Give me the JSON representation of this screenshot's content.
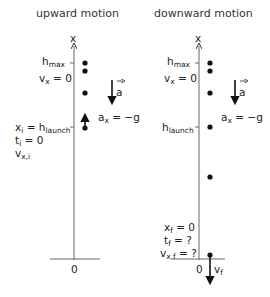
{
  "panels": {
    "upward": {
      "title": "upward motion",
      "axis_label": "x",
      "origin_label": "0",
      "top": {
        "h": "h",
        "h_sub": "max",
        "v": "v",
        "v_sub": "x",
        "v_eq": " = 0"
      },
      "accel": {
        "vector": "a",
        "a": "a",
        "a_sub": "x",
        "a_eq": " = −g"
      },
      "launch": {
        "x": "x",
        "x_sub": "i",
        "eq": " = h",
        "h_sub": "launch",
        "t": "t",
        "t_sub": "i",
        "t_eq": " = 0",
        "v": "v",
        "v_sub": "x,i"
      }
    },
    "downward": {
      "title": "downward motion",
      "axis_label": "x",
      "origin_label": "0",
      "top": {
        "h": "h",
        "h_sub": "max",
        "v": "v",
        "v_sub": "x",
        "v_eq": " = 0"
      },
      "accel": {
        "vector": "a",
        "a": "a",
        "a_sub": "x",
        "a_eq": " = −g"
      },
      "launch": {
        "h": "h",
        "h_sub": "launch"
      },
      "final": {
        "x": "x",
        "x_sub": "f",
        "x_eq": " = 0",
        "t": "t",
        "t_sub": "f",
        "t_eq": " = ?",
        "v": "v",
        "v_sub": "x,f",
        "v_eq": " = ?",
        "vf": "v",
        "vf_sub": "f"
      }
    }
  },
  "colors": {
    "ink": "#1a1a1a",
    "axis": "#555555"
  }
}
